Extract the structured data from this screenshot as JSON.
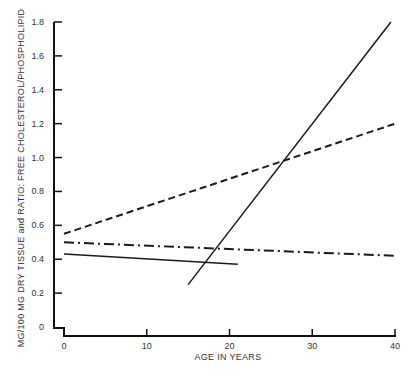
{
  "chart_data": {
    "type": "line",
    "title": "",
    "xlabel": "AGE IN YEARS",
    "ylabel": "MG/100 MG DRY TISSUE and RATIO: FREE CHOLESTEROL/PHOSPHOLIPID",
    "xlim": [
      0,
      40
    ],
    "ylim": [
      0,
      1.8
    ],
    "x_ticks": [
      "0",
      "10",
      "20",
      "30",
      "40"
    ],
    "y_ticks": [
      "0",
      "0.2",
      "0.4",
      "0.6",
      "0.8",
      "1.0",
      "1.2",
      "1.4",
      "1.6",
      "1.8"
    ],
    "grid": false,
    "legend": null,
    "series": [
      {
        "name": "dashed line",
        "style": "dashed",
        "x": [
          0,
          40
        ],
        "y": [
          0.55,
          1.2
        ]
      },
      {
        "name": "dash-dot line",
        "style": "dash-dot",
        "x": [
          0,
          40
        ],
        "y": [
          0.5,
          0.42
        ]
      },
      {
        "name": "solid line (short)",
        "style": "solid",
        "x": [
          0,
          21
        ],
        "y": [
          0.43,
          0.37
        ]
      },
      {
        "name": "solid line (steep)",
        "style": "solid",
        "x": [
          15,
          39.5
        ],
        "y": [
          0.25,
          1.8
        ]
      }
    ]
  },
  "axis": {
    "x_title": "AGE IN YEARS",
    "y_title": "MG/100 MG DRY TISSUE and RATIO: FREE CHOLESTEROL/PHOSPHOLIPID",
    "x_labels": [
      "0",
      "10",
      "20",
      "30",
      "40"
    ],
    "y_labels": [
      "0",
      "0.2",
      "0.4",
      "0.6",
      "0.8",
      "1.0",
      "1.2",
      "1.4",
      "1.6",
      "1.8"
    ]
  }
}
